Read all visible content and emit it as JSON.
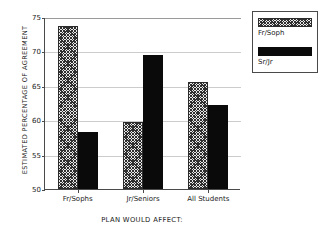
{
  "chart_data": {
    "type": "bar",
    "title": "",
    "xlabel": "PLAN WOULD AFFECT:",
    "ylabel": "ESTIMATED PERCENTAGE OF AGREEMENT",
    "categories": [
      "Fr/Sophs",
      "Jr/Seniors",
      "All Students"
    ],
    "series": [
      {
        "name": "Fr/Soph",
        "values": [
          73.7,
          59.8,
          65.5
        ],
        "fill": "hatch"
      },
      {
        "name": "Sr/Jr",
        "values": [
          58.3,
          69.5,
          62.2
        ],
        "fill": "solid"
      }
    ],
    "ylim": [
      50,
      75
    ],
    "yticks": [
      75,
      70,
      65,
      60,
      55,
      50
    ],
    "ytick_labels": [
      "75",
      "70",
      "65",
      "60",
      "55",
      "50"
    ],
    "grid": true,
    "legend_position": "top-right",
    "colors": {
      "series_hatch": "#2f2f2f",
      "series_solid": "#0a0a0a",
      "axis": "#4a4a4a",
      "gridline": "#cccccc",
      "background": "#ffffff"
    }
  }
}
